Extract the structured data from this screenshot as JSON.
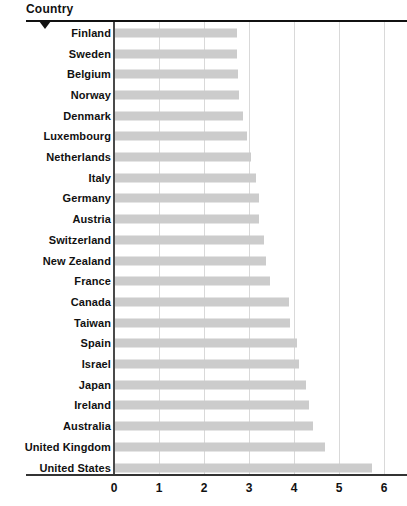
{
  "header": {
    "title": "Country",
    "sort_marker": "descending-caret"
  },
  "colors": {
    "bar": "#cccccc",
    "gridline": "#d9d9d9",
    "axis": "#333333",
    "text": "#111111",
    "background": "#ffffff"
  },
  "axis": {
    "xticks": [
      "0",
      "1",
      "2",
      "3",
      "4",
      "5",
      "6"
    ]
  },
  "chart_data": {
    "type": "bar",
    "orientation": "horizontal",
    "title": "",
    "subtitle": "",
    "xlabel": "",
    "ylabel": "Country",
    "xlim": [
      0,
      6
    ],
    "ylim": null,
    "grid": true,
    "legend": false,
    "legend_position": "none",
    "categories": [
      "Finland",
      "Sweden",
      "Belgium",
      "Norway",
      "Denmark",
      "Luxembourg",
      "Netherlands",
      "Italy",
      "Germany",
      "Austria",
      "Switzerland",
      "New Zealand",
      "France",
      "Canada",
      "Taiwan",
      "Spain",
      "Israel",
      "Japan",
      "Ireland",
      "Australia",
      "United Kingdom",
      "United States"
    ],
    "values": [
      2.72,
      2.72,
      2.73,
      2.75,
      2.85,
      2.93,
      3.02,
      3.13,
      3.2,
      3.2,
      3.3,
      3.35,
      3.45,
      3.87,
      3.88,
      4.05,
      4.08,
      4.25,
      4.3,
      4.4,
      4.67,
      5.72
    ],
    "xticks": [
      0,
      1,
      2,
      3,
      4,
      5,
      6
    ]
  }
}
